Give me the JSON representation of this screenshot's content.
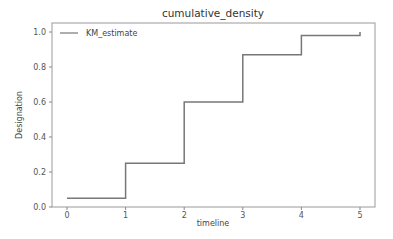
{
  "chart_data": {
    "type": "line",
    "subtype": "step-post",
    "title": "cumulative_density",
    "xlabel": "timeline",
    "ylabel": "Designation",
    "xlim": [
      -0.25,
      5.25
    ],
    "ylim": [
      0.0,
      1.05
    ],
    "xticks": [
      0,
      1,
      2,
      3,
      4,
      5
    ],
    "xtick_labels": [
      "0",
      "1",
      "2",
      "3",
      "4",
      "5"
    ],
    "yticks": [
      0.0,
      0.2,
      0.4,
      0.6,
      0.8,
      1.0
    ],
    "ytick_labels": [
      "0.0",
      "0.2",
      "0.4",
      "0.6",
      "0.8",
      "1.0"
    ],
    "grid": false,
    "legend": {
      "position": "upper left",
      "entries": [
        "KM_estimate"
      ]
    },
    "series": [
      {
        "name": "KM_estimate",
        "color": "#777777",
        "x": [
          0,
          1,
          2,
          3,
          4,
          5
        ],
        "values": [
          0.05,
          0.25,
          0.6,
          0.87,
          0.98,
          1.0
        ]
      }
    ]
  },
  "colors": {
    "line": "#777777",
    "axes": "#888888",
    "background": "#ffffff"
  }
}
